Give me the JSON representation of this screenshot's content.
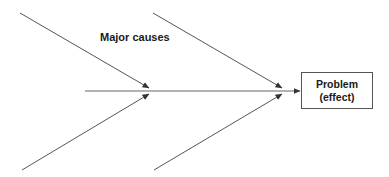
{
  "diagram": {
    "type": "fishbone",
    "label": "Major causes",
    "effect": {
      "line1": "Problem",
      "line2": "(effect)"
    },
    "colors": {
      "line": "#555555",
      "text": "#1a1a1a",
      "background": "#ffffff"
    },
    "branches": [
      {
        "name": "top-left",
        "from": [
          20,
          13
        ],
        "to": [
          149,
          88
        ]
      },
      {
        "name": "top-right",
        "from": [
          153,
          13
        ],
        "to": [
          282,
          88
        ]
      },
      {
        "name": "bottom-left",
        "from": [
          22,
          170
        ],
        "to": [
          149,
          94
        ]
      },
      {
        "name": "bottom-right",
        "from": [
          154,
          170
        ],
        "to": [
          282,
          94
        ]
      }
    ],
    "spine": {
      "from": [
        85,
        91
      ],
      "to": [
        300,
        91
      ]
    }
  }
}
